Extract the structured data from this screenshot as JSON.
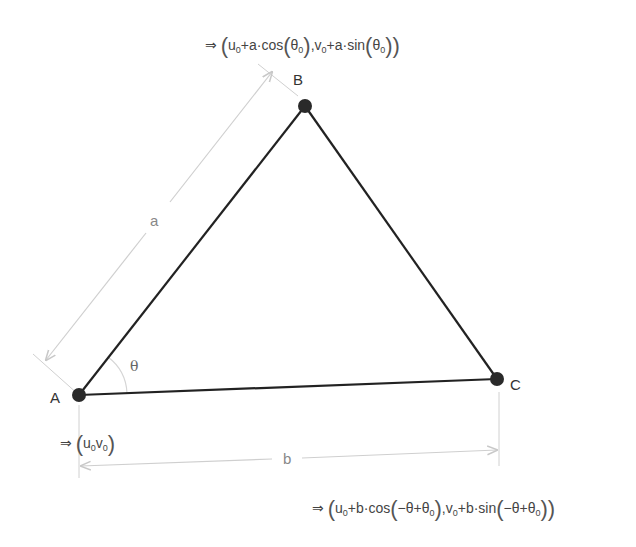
{
  "diagram": {
    "type": "triangle-coordinate-derivation",
    "vertices": {
      "A": {
        "label": "A",
        "x": 79,
        "y": 395
      },
      "B": {
        "label": "B",
        "x": 305,
        "y": 106
      },
      "C": {
        "label": "C",
        "x": 497,
        "y": 379
      }
    },
    "sides": {
      "a": {
        "label": "a",
        "from": "A",
        "to": "B"
      },
      "b": {
        "label": "b",
        "from": "A",
        "to": "C"
      }
    },
    "angle": {
      "label": "θ",
      "at": "A"
    },
    "formulas": {
      "A": "⇒ (u₀, v₀)",
      "B": "⇒ (u₀+a·cos(θ₀), v₀+a·sin(θ₀))",
      "C": "⇒ (u₀+b·cos(−θ+θ₀), v₀+b·sin(−θ+θ₀))"
    },
    "colors": {
      "edge": "#222222",
      "vertex": "#2a2a2a",
      "dimension": "#cccccc",
      "text": "#333333"
    }
  },
  "text": {
    "arrow": "⇒",
    "a_label": "a",
    "b_label": "b",
    "theta": "θ",
    "A": "A",
    "B": "B",
    "C": "C"
  }
}
